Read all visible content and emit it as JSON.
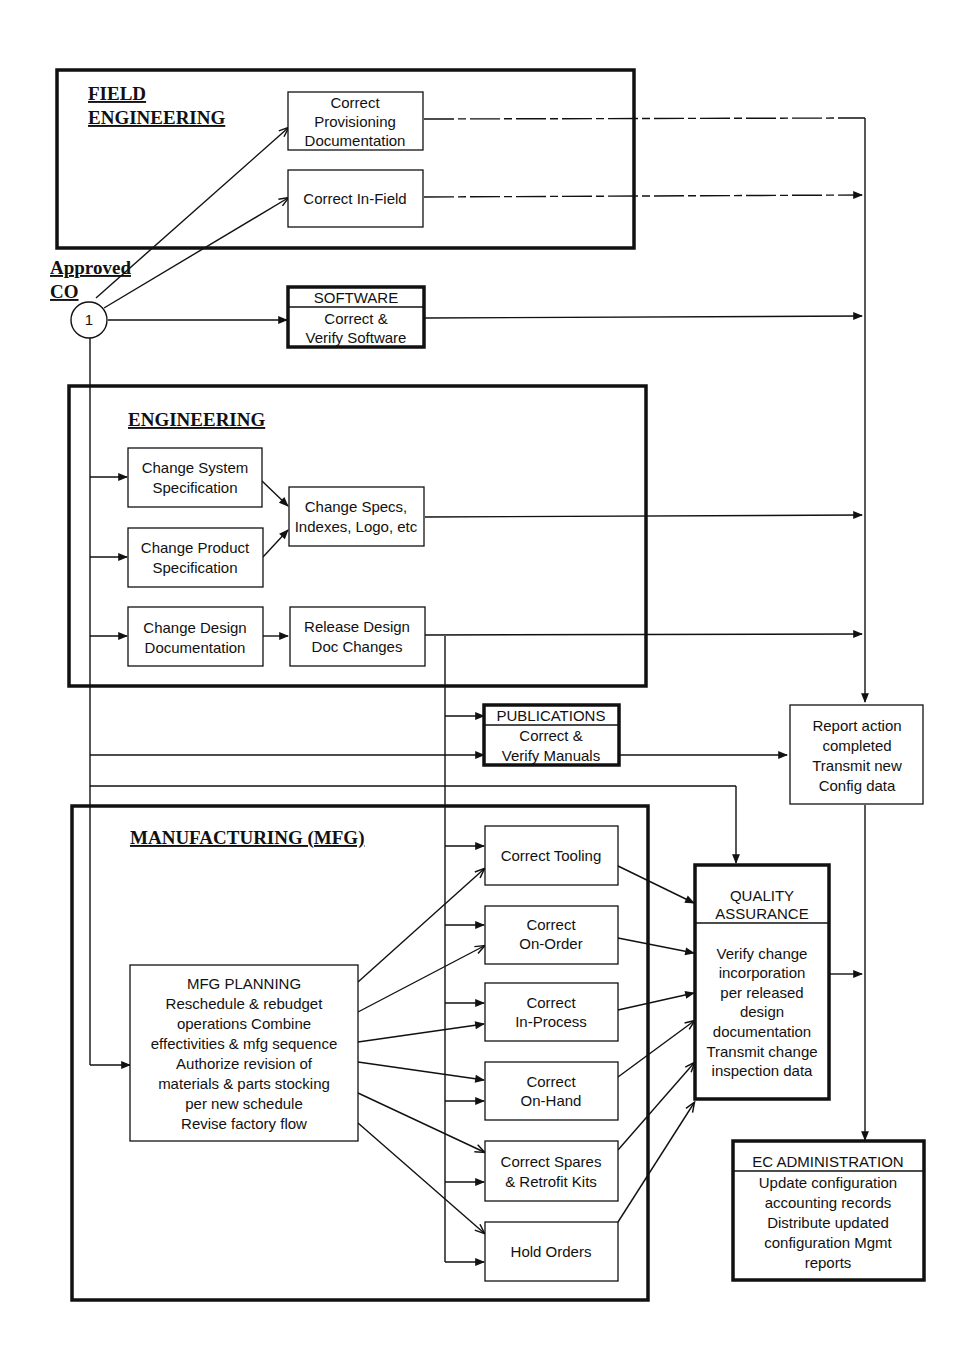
{
  "approved_co": {
    "line1": "Approved",
    "line2": "CO",
    "node_label": "1"
  },
  "field_engineering": {
    "title_line1": "FIELD",
    "title_line2": "ENGINEERING",
    "boxes": [
      {
        "lines": [
          "Correct",
          "Provisioning",
          "Documentation"
        ]
      },
      {
        "lines": [
          "Correct In-Field"
        ]
      }
    ]
  },
  "software": {
    "header": "SOFTWARE",
    "lines": [
      "Correct &",
      "Verify Software"
    ]
  },
  "engineering": {
    "title": "ENGINEERING",
    "boxes": [
      {
        "lines": [
          "Change System",
          "Specification"
        ]
      },
      {
        "lines": [
          "Change Product",
          "Specification"
        ]
      },
      {
        "lines": [
          "Change  Specs,",
          "Indexes, Logo, etc"
        ]
      },
      {
        "lines": [
          "Change Design",
          "Documentation"
        ]
      },
      {
        "lines": [
          "Release Design",
          "Doc Changes"
        ]
      }
    ]
  },
  "publications": {
    "header": "PUBLICATIONS",
    "lines": [
      "Correct &",
      "Verify Manuals"
    ]
  },
  "report": {
    "lines": [
      "Report action",
      "completed",
      "Transmit new",
      "Config data"
    ]
  },
  "manufacturing": {
    "title": "MANUFACTURING (MFG)",
    "planning": {
      "lines": [
        "MFG PLANNING",
        "Reschedule & rebudget",
        "operations  Combine",
        "effectivities & mfg sequence",
        "Authorize revision of",
        "materials & parts stocking",
        "per new schedule",
        "Revise factory flow"
      ]
    },
    "boxes": [
      {
        "lines": [
          "Correct Tooling"
        ]
      },
      {
        "lines": [
          "Correct",
          "On-Order"
        ]
      },
      {
        "lines": [
          "Correct",
          "In-Process"
        ]
      },
      {
        "lines": [
          "Correct",
          "On-Hand"
        ]
      },
      {
        "lines": [
          "Correct Spares",
          "& Retrofit Kits"
        ]
      },
      {
        "lines": [
          "Hold Orders"
        ]
      }
    ]
  },
  "quality_assurance": {
    "header_lines": [
      "QUALITY",
      "ASSURANCE"
    ],
    "lines": [
      "Verify change",
      "incorporation",
      "per released",
      "design",
      "documentation",
      "Transmit change",
      "inspection data"
    ]
  },
  "ec_administration": {
    "header": "EC ADMINISTRATION",
    "lines": [
      "Update configuration",
      "accounting records",
      "Distribute updated",
      "configuration Mgmt",
      "reports"
    ]
  }
}
